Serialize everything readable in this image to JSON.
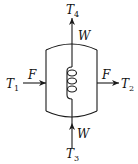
{
  "diagram": {
    "type": "stirred-tank-heat-exchanger",
    "colors": {
      "line": "#1a1a1a",
      "background": "#ffffff"
    },
    "labels": {
      "inlet_temp": {
        "symbol": "T",
        "sub": "1"
      },
      "outlet_temp": {
        "symbol": "T",
        "sub": "2"
      },
      "coolant_inlet_temp": {
        "symbol": "T",
        "sub": "3"
      },
      "coolant_outlet_temp": {
        "symbol": "T",
        "sub": "4"
      },
      "feed_in": "F",
      "feed_out": "F",
      "coolant_in": "W",
      "coolant_out": "W"
    },
    "components": [
      "vessel",
      "heating-coil",
      "inlet-stream",
      "outlet-stream",
      "coolant-inlet",
      "coolant-outlet"
    ]
  }
}
